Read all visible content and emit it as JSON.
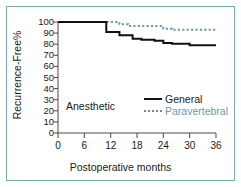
{
  "figure": {
    "frame_color": "#76a8ae",
    "background": "#ffffff"
  },
  "axes": {
    "ylabel": "Recurrence-Free%",
    "xlabel": "Postoperative months",
    "ytick_labels": [
      "100",
      "90",
      "80",
      "70",
      "60",
      "50",
      "40",
      "30",
      "20",
      "10",
      "0"
    ],
    "xtick_labels": [
      "0",
      "6",
      "12",
      "18",
      "24",
      "30",
      "36"
    ]
  },
  "legend": {
    "group_label": "Anesthetic",
    "items": [
      {
        "label": "General",
        "style": "solid",
        "color": "#111111",
        "icon": "solid-line-icon"
      },
      {
        "label": "Paravertebral",
        "style": "dotted",
        "color": "#6e98ac",
        "icon": "dotted-line-icon"
      }
    ]
  },
  "chart_data": {
    "type": "line",
    "title": "",
    "xlabel": "Postoperative months",
    "ylabel": "Recurrence-Free%",
    "xlim": [
      0,
      36
    ],
    "ylim": [
      0,
      100
    ],
    "xticks": [
      0,
      6,
      12,
      18,
      24,
      30,
      36
    ],
    "yticks": [
      0,
      10,
      20,
      30,
      40,
      50,
      60,
      70,
      80,
      90,
      100
    ],
    "grid": false,
    "legend_position": "center",
    "interpolation": "step-post",
    "series": [
      {
        "name": "General",
        "color": "#111111",
        "style": "solid",
        "x": [
          0,
          11,
          11,
          14,
          14,
          17,
          17,
          19,
          19,
          22,
          22,
          24,
          24,
          26,
          26,
          30,
          30,
          36
        ],
        "y": [
          100,
          100,
          91,
          91,
          88,
          88,
          85,
          85,
          84,
          84,
          83,
          83,
          81,
          81,
          80.5,
          80.5,
          79,
          79
        ]
      },
      {
        "name": "Paravertebral",
        "color": "#6e98ac",
        "style": "dotted",
        "x": [
          0,
          14,
          14,
          16,
          16,
          24,
          24,
          26,
          26,
          36
        ],
        "y": [
          100,
          100,
          98,
          98,
          96.5,
          96.5,
          94,
          94,
          93,
          93
        ]
      }
    ]
  }
}
